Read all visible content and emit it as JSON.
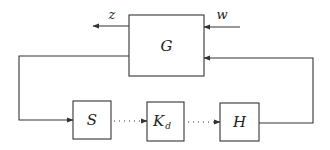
{
  "diagram": {
    "type": "block-diagram",
    "blocks": [
      {
        "id": "G",
        "label": "G"
      },
      {
        "id": "S",
        "label": "S"
      },
      {
        "id": "Kd",
        "label": "K",
        "subscript": "d"
      },
      {
        "id": "H",
        "label": "H"
      }
    ],
    "signals": {
      "output": "z",
      "input": "w"
    },
    "connections": [
      {
        "from": "G",
        "to": "z",
        "style": "solid",
        "label": "z"
      },
      {
        "from": "w",
        "to": "G",
        "style": "solid",
        "label": "w"
      },
      {
        "from": "G",
        "to": "S",
        "style": "solid"
      },
      {
        "from": "S",
        "to": "Kd",
        "style": "dotted"
      },
      {
        "from": "Kd",
        "to": "H",
        "style": "dotted"
      },
      {
        "from": "H",
        "to": "G",
        "style": "solid"
      }
    ]
  }
}
